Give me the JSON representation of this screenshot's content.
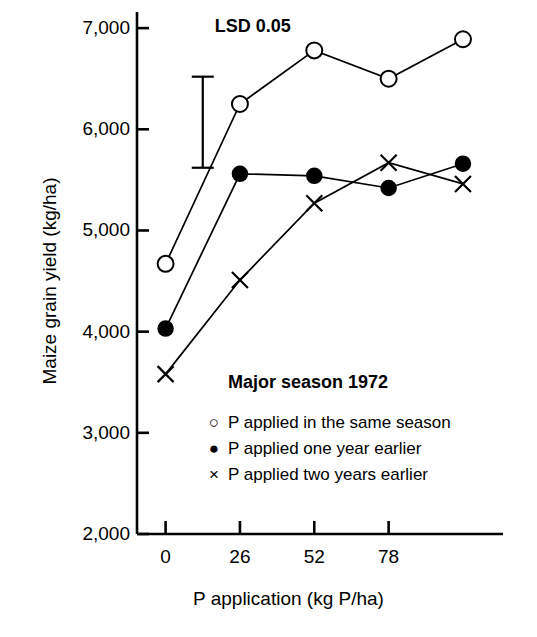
{
  "chart_data": {
    "type": "line",
    "title": "",
    "annotation_title": "Major season 1972",
    "xlabel": "P application (kg P/ha)",
    "ylabel": "Maize grain yield (kg/ha)",
    "x": [
      0,
      26,
      52,
      78,
      104
    ],
    "xtick_values": [
      0,
      26,
      52,
      78
    ],
    "xtick_labels": [
      "0",
      "26",
      "52",
      "78"
    ],
    "ytick_values": [
      2000,
      3000,
      4000,
      5000,
      6000,
      7000
    ],
    "ytick_labels": [
      "2,000",
      "3,000",
      "4,000",
      "5,000",
      "6,000",
      "7,000"
    ],
    "xlim": [
      -10,
      118
    ],
    "ylim": [
      2000,
      7100
    ],
    "grid": false,
    "legend_position": "inside-lower-center",
    "series": [
      {
        "name": "P applied in the same season",
        "marker": "open-circle",
        "values": [
          4670,
          6250,
          6780,
          6500,
          6890
        ]
      },
      {
        "name": "P applied one year earlier",
        "marker": "filled-circle",
        "values": [
          4030,
          5560,
          5540,
          5420,
          5660
        ]
      },
      {
        "name": "P applied two years earlier",
        "marker": "cross",
        "values": [
          3580,
          4510,
          5270,
          5670,
          5460
        ]
      }
    ],
    "error_bar": {
      "label": "LSD 0.05",
      "upper": 6520,
      "lower": 5620,
      "x_position": 13
    },
    "colors": {
      "line": "#000000",
      "axis": "#000000",
      "background": "#ffffff"
    }
  }
}
